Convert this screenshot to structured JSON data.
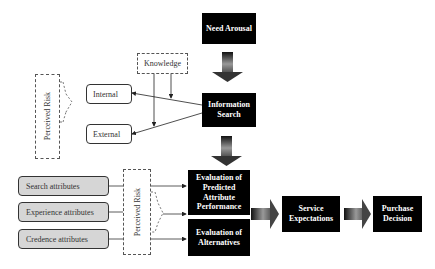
{
  "diagram": {
    "nodes": {
      "need_arousal": "Need Arousal",
      "information_search": "Information Search",
      "knowledge": "Knowledge",
      "perceived_risk_top": "Perceived Risk",
      "internal": "Internal",
      "external": "External",
      "search_attributes": "Search attributes",
      "experience_attributes": "Experience attributes",
      "credence_attributes": "Credence attributes",
      "perceived_risk_bottom": "Perceived Risk",
      "evaluation_predicted": "Evaluation of Predicted Attribute Performance",
      "evaluation_alternatives": "Evaluation of Alternatives",
      "service_expectations": "Service Expectations",
      "purchase_decision": "Purchase Decision"
    },
    "edges": [
      {
        "from": "Need Arousal",
        "to": "Information Search",
        "style": "block-arrow"
      },
      {
        "from": "Information Search",
        "to": "Internal",
        "style": "line-arrow"
      },
      {
        "from": "Information Search",
        "to": "External",
        "style": "line-arrow"
      },
      {
        "from": "Knowledge",
        "to": "Information Search",
        "style": "line-arrow"
      },
      {
        "from": "Knowledge",
        "to": "External",
        "style": "line-arrow"
      },
      {
        "from": "Information Search",
        "to": "Evaluation of Predicted Attribute Performance",
        "style": "block-arrow"
      },
      {
        "from": "Search attributes",
        "to": "Evaluation of Predicted Attribute Performance",
        "style": "line-arrow"
      },
      {
        "from": "Experience attributes",
        "to": "Evaluation of Predicted Attribute Performance",
        "style": "line-arrow"
      },
      {
        "from": "Credence attributes",
        "to": "Evaluation of Alternatives",
        "style": "line-arrow"
      },
      {
        "from": "Evaluation",
        "to": "Service Expectations",
        "style": "block-arrow"
      },
      {
        "from": "Service Expectations",
        "to": "Purchase Decision",
        "style": "block-arrow"
      }
    ],
    "colors": {
      "process_box": "#000000",
      "attribute_box": "#d6d6d6",
      "line": "#333333"
    }
  }
}
